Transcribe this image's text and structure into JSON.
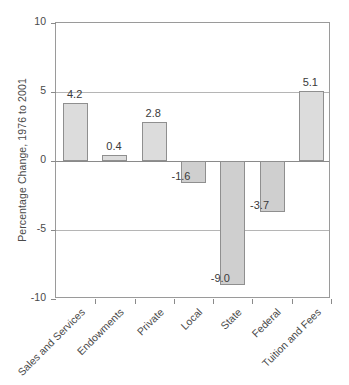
{
  "chart_data": {
    "type": "bar",
    "title": "",
    "xlabel": "",
    "ylabel": "Percentage Change, 1976 to 2001",
    "ylim": [
      -10,
      10
    ],
    "yticks": [
      10,
      5,
      0,
      -5,
      -10
    ],
    "ytick_labels": [
      "10",
      "5",
      "0",
      "-5",
      "-10"
    ],
    "grid": true,
    "legend": "none",
    "categories": [
      "Sales and Services",
      "Endowments",
      "Private",
      "Local",
      "State",
      "Federal",
      "Tuition and Fees"
    ],
    "values": [
      4.2,
      0.4,
      2.8,
      -1.6,
      -9.0,
      -3.7,
      5.1
    ],
    "value_labels": [
      "4.2",
      "0.4",
      "2.8",
      "-1.6",
      "-9.0",
      "-3.7",
      "5.1"
    ],
    "colors": {
      "bar_fill_positive": "#dcdcdc",
      "bar_fill_negative": "#cfcfcf",
      "bar_stroke": "#8f8f8f",
      "axis": "#9a9a9a",
      "gridline": "#b5b5b5",
      "text": "#4a4a4a",
      "background": "#ffffff"
    }
  }
}
